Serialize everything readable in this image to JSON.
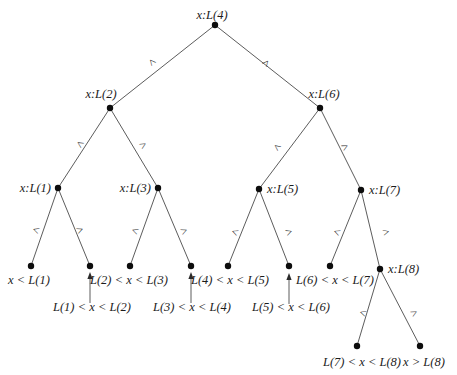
{
  "figure": {
    "kind": "binary-search-decision-tree",
    "background_color": "#ffffff",
    "line_color": "#4a4a4a",
    "dot_color": "#0d0d0d",
    "text_color": "#1c1c1c",
    "nodes": [
      {
        "id": "N4",
        "label": "x:L(4)",
        "x": 215,
        "y": 25,
        "lx": 212,
        "ly": 19,
        "anchor": "middle"
      },
      {
        "id": "N2",
        "label": "x:L(2)",
        "x": 110,
        "y": 108,
        "lx": 101,
        "ly": 98,
        "anchor": "middle"
      },
      {
        "id": "N6",
        "label": "x:L(6)",
        "x": 320,
        "y": 108,
        "lx": 324,
        "ly": 98,
        "anchor": "middle"
      },
      {
        "id": "N1",
        "label": "x:L(1)",
        "x": 58,
        "y": 188,
        "lx": 51,
        "ly": 192,
        "anchor": "end"
      },
      {
        "id": "N3",
        "label": "x:L(3)",
        "x": 158,
        "y": 188,
        "lx": 151,
        "ly": 192,
        "anchor": "end"
      },
      {
        "id": "N5",
        "label": "x:L(5)",
        "x": 259,
        "y": 189,
        "lx": 267,
        "ly": 193,
        "anchor": "start"
      },
      {
        "id": "N7",
        "label": "x:L(7)",
        "x": 361,
        "y": 190,
        "lx": 369,
        "ly": 194,
        "anchor": "start"
      },
      {
        "id": "N8",
        "label": "x:L(8)",
        "x": 380,
        "y": 269,
        "lx": 388,
        "ly": 273,
        "anchor": "start"
      }
    ],
    "leaves": [
      {
        "id": "F1",
        "label": "x < L(1)",
        "x": 31,
        "y": 266,
        "lx": 29,
        "ly": 284,
        "anchor": "middle"
      },
      {
        "id": "F2",
        "label": "L(1) < x < L(2)",
        "x": 90,
        "y": 266,
        "lx": 92,
        "ly": 311,
        "anchor": "middle"
      },
      {
        "id": "F3",
        "label": "L(2) < x < L(3)",
        "x": 130,
        "y": 266,
        "lx": 129,
        "ly": 284,
        "anchor": "middle"
      },
      {
        "id": "F4",
        "label": "L(3) < x < L(4)",
        "x": 191,
        "y": 266,
        "lx": 192,
        "ly": 311,
        "anchor": "middle"
      },
      {
        "id": "F5",
        "label": "L(4) < x < L(5)",
        "x": 228,
        "y": 266,
        "lx": 230,
        "ly": 284,
        "anchor": "middle"
      },
      {
        "id": "F6",
        "label": "L(5) < x < L(6)",
        "x": 289,
        "y": 266,
        "lx": 291,
        "ly": 311,
        "anchor": "middle"
      },
      {
        "id": "F7",
        "label": "L(6) < x < L(7)",
        "x": 330,
        "y": 266,
        "lx": 335,
        "ly": 284,
        "anchor": "middle"
      },
      {
        "id": "F8",
        "label": "L(7) < x < L(8)",
        "x": 357,
        "y": 346,
        "lx": 362,
        "ly": 366,
        "anchor": "middle"
      },
      {
        "id": "F9",
        "label": "x > L(8)",
        "x": 420,
        "y": 346,
        "lx": 424,
        "ly": 366,
        "anchor": "middle"
      }
    ],
    "edges": [
      {
        "from": "N4",
        "to": "N2",
        "label": "<",
        "lx": 152,
        "ly": 62,
        "rot": 50
      },
      {
        "from": "N4",
        "to": "N6",
        "label": ">",
        "lx": 266,
        "ly": 63,
        "rot": -50
      },
      {
        "from": "N2",
        "to": "N1",
        "label": "<",
        "lx": 80,
        "ly": 144,
        "rot": 33
      },
      {
        "from": "N2",
        "to": "N3",
        "label": ">",
        "lx": 143,
        "ly": 145,
        "rot": -31
      },
      {
        "from": "N6",
        "to": "N5",
        "label": "<",
        "lx": 277,
        "ly": 147,
        "rot": 37
      },
      {
        "from": "N6",
        "to": "N7",
        "label": ">",
        "lx": 345,
        "ly": 147,
        "rot": -27
      },
      {
        "from": "N1",
        "to": "F1",
        "label": "<",
        "lx": 36,
        "ly": 230,
        "rot": 19
      },
      {
        "from": "N1",
        "to": "F2",
        "label": ">",
        "lx": 80,
        "ly": 230,
        "rot": -22
      },
      {
        "from": "N3",
        "to": "F3",
        "label": "<",
        "lx": 135,
        "ly": 231,
        "rot": 20
      },
      {
        "from": "N3",
        "to": "F4",
        "label": ">",
        "lx": 184,
        "ly": 231,
        "rot": -23
      },
      {
        "from": "N5",
        "to": "F5",
        "label": "<",
        "lx": 235,
        "ly": 232,
        "rot": 22
      },
      {
        "from": "N5",
        "to": "F6",
        "label": ">",
        "lx": 289,
        "ly": 232,
        "rot": -21
      },
      {
        "from": "N7",
        "to": "F7",
        "label": "<",
        "lx": 337,
        "ly": 232,
        "rot": 22
      },
      {
        "from": "N7",
        "to": "N8",
        "label": ">",
        "lx": 386,
        "ly": 232,
        "rot": -14
      },
      {
        "from": "N8",
        "to": "F8",
        "label": "<",
        "lx": 363,
        "ly": 313,
        "rot": 17
      },
      {
        "from": "N8",
        "to": "F9",
        "label": ">",
        "lx": 414,
        "ly": 313,
        "rot": -28
      }
    ],
    "arrows": [
      {
        "points_to": "F2",
        "x": 90,
        "y1": 303,
        "y2": 273
      },
      {
        "points_to": "F4",
        "x": 191,
        "y1": 303,
        "y2": 273
      },
      {
        "points_to": "F6",
        "x": 289,
        "y1": 304,
        "y2": 274
      }
    ]
  }
}
